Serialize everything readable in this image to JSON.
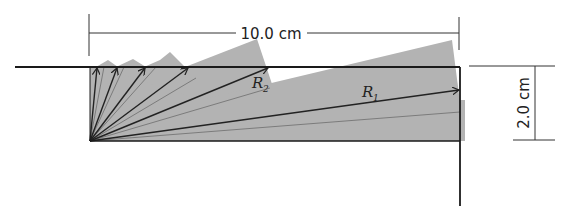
{
  "diagram": {
    "colors": {
      "wedge_fill": "#b3b3b3",
      "line": "#222222",
      "background": "#ffffff"
    },
    "labels": {
      "width_dimension": "10.0 cm",
      "height_dimension": "2.0 cm",
      "r1_main": "R",
      "r1_sub": "1",
      "r2_main": "R",
      "r2_sub": "2"
    },
    "origin": [
      90,
      141
    ],
    "wedges": [
      {
        "tip": [
          91,
          141
        ],
        "points": [
          [
            90,
            141
          ],
          [
            90,
            67
          ],
          [
            98,
            67
          ]
        ]
      },
      {
        "tip": [
          90,
          141
        ],
        "points": [
          [
            90,
            141
          ],
          [
            96,
            67
          ],
          [
            110,
            62
          ],
          [
            116,
            67
          ]
        ]
      },
      {
        "tip": [
          90,
          141
        ],
        "points": [
          [
            90,
            141
          ],
          [
            114,
            67
          ],
          [
            134,
            60
          ],
          [
            144,
            67
          ]
        ]
      },
      {
        "tip": [
          90,
          141
        ],
        "points": [
          [
            90,
            141
          ],
          [
            140,
            67
          ],
          [
            165,
            52
          ],
          [
            178,
            67
          ]
        ]
      },
      {
        "tip": [
          90,
          141
        ],
        "points": [
          [
            90,
            141
          ],
          [
            180,
            67
          ],
          [
            256,
            39
          ],
          [
            273,
            85
          ]
        ]
      },
      {
        "tip": [
          90,
          141
        ],
        "points": [
          [
            90,
            141
          ],
          [
            273,
            85
          ],
          [
            452,
            40
          ],
          [
            465,
            141
          ]
        ]
      }
    ],
    "arrows": [
      {
        "name": "ray-1",
        "to": [
          97,
          67
        ]
      },
      {
        "name": "ray-2",
        "to": [
          117,
          67
        ]
      },
      {
        "name": "ray-3",
        "to": [
          145,
          67
        ]
      },
      {
        "name": "ray-4",
        "to": [
          188,
          67
        ]
      },
      {
        "name": "ray-R2",
        "to": [
          268,
          67
        ]
      },
      {
        "name": "ray-R1",
        "to": [
          460,
          90
        ]
      }
    ],
    "thin_rays": [
      [
        98,
        67
      ],
      [
        108,
        67
      ],
      [
        128,
        67
      ],
      [
        160,
        67
      ],
      [
        220,
        95
      ],
      [
        300,
        110
      ],
      [
        460,
        118
      ]
    ]
  }
}
